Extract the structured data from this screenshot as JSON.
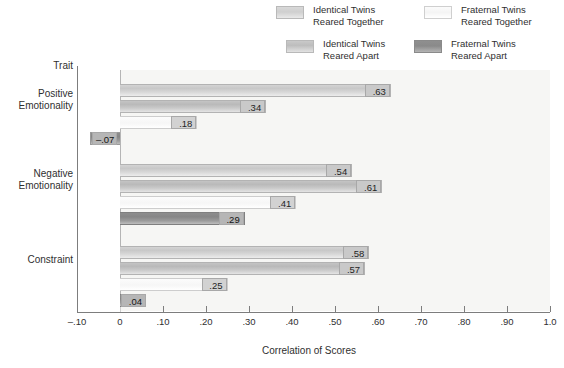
{
  "chart_data": {
    "type": "bar",
    "orientation": "horizontal",
    "title": "",
    "xlabel": "Correlation of Scores",
    "ylabel": "Trait",
    "xlim": [
      -0.1,
      1.0
    ],
    "xticks": [
      "–.10",
      "0",
      ".10",
      ".20",
      ".30",
      ".40",
      ".50",
      ".60",
      ".70",
      ".80",
      ".90",
      "1.0"
    ],
    "xtick_values": [
      -0.1,
      0,
      0.1,
      0.2,
      0.3,
      0.4,
      0.5,
      0.6,
      0.7,
      0.8,
      0.9,
      1.0
    ],
    "grid": false,
    "legend_position": "top",
    "categories": [
      "Positive Emotionality",
      "Negative Emotionality",
      "Constraint"
    ],
    "series": [
      {
        "name": "Identical Twins Reared Together",
        "values": [
          0.63,
          0.54,
          0.58
        ],
        "labels": [
          ".63",
          ".54",
          ".58"
        ]
      },
      {
        "name": "Identical Twins Reared Apart",
        "values": [
          0.34,
          0.61,
          0.57
        ],
        "labels": [
          ".34",
          ".61",
          ".57"
        ]
      },
      {
        "name": "Fraternal Twins Reared Together",
        "values": [
          0.18,
          0.41,
          0.25
        ],
        "labels": [
          ".18",
          ".41",
          ".25"
        ]
      },
      {
        "name": "Fraternal Twins Reared Apart",
        "values": [
          -0.07,
          0.29,
          0.04
        ],
        "labels": [
          "–.07",
          ".29",
          ".04"
        ]
      }
    ]
  },
  "legend": {
    "items": [
      {
        "line1": "Identical Twins",
        "line2": "Reared Together",
        "swatch": "identical-together-swatch"
      },
      {
        "line1": "Fraternal Twins",
        "line2": "Reared Together",
        "swatch": "fraternal-together-swatch"
      },
      {
        "line1": "Identical Twins",
        "line2": "Reared Apart",
        "swatch": "identical-apart-swatch"
      },
      {
        "line1": "Fraternal Twins",
        "line2": "Reared Apart",
        "swatch": "fraternal-apart-swatch"
      }
    ]
  },
  "y_axis": {
    "header": "Trait",
    "categories": [
      {
        "line1": "Positive",
        "line2": "Emotionality"
      },
      {
        "line1": "Negative",
        "line2": "Emotionality"
      },
      {
        "line1": "Constraint",
        "line2": ""
      }
    ]
  },
  "colors": {
    "identical_together": "#cfcfcf",
    "identical_apart": "#c0c0c0",
    "fraternal_together": "#f8f8f8",
    "fraternal_apart": "#8b8b8b",
    "plot_background": "#f6f6f4",
    "axis": "#7d7d7d",
    "text": "#2f2f2f"
  }
}
